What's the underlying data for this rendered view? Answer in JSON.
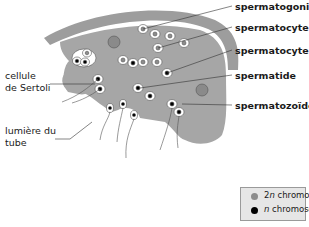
{
  "diagram": {
    "type": "biology-illustration",
    "colors": {
      "tissue": "#a6a6a6",
      "wall": "#9d9d9d",
      "cell_fill": "#ffffff",
      "nucleus_2n": "#8c8c8c",
      "nucleus_n": "#000000",
      "sertoli_nucleus": "#8a8a8a",
      "legend_bg": "#e6e6e6"
    }
  },
  "labels": {
    "right": [
      {
        "text": "spermatogonie"
      },
      {
        "text": "spermatocyte 1"
      },
      {
        "text": "spermatocyte 2"
      },
      {
        "text": "spermatide"
      },
      {
        "text": "spermatozoïde"
      }
    ],
    "left": [
      {
        "line1": "cellule",
        "line2": "de Sertoli"
      },
      {
        "line1": "lumière du",
        "line2": "tube"
      }
    ]
  },
  "legend": {
    "items": [
      {
        "prefix": "2",
        "italic": "n",
        "suffix": " chromosomes",
        "color": "#8c8c8c"
      },
      {
        "prefix": "",
        "italic": "n",
        "suffix": " chromosomes",
        "color": "#000000"
      }
    ]
  }
}
